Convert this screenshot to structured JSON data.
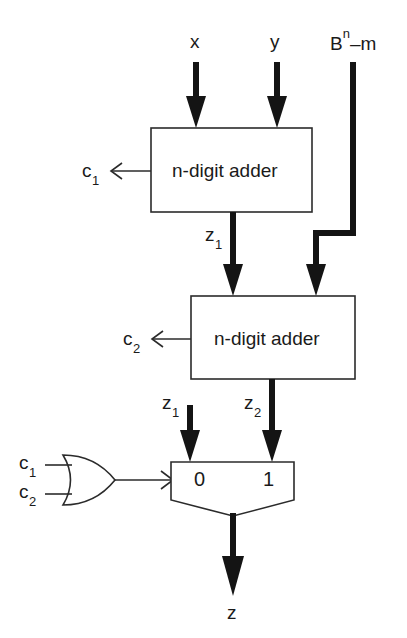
{
  "figure": {
    "type": "block-diagram",
    "background_color": "#ffffff",
    "line_color": "#2b2b2b",
    "signal_color": "#141414"
  },
  "inputs": {
    "x": "x",
    "y": "y",
    "constant": {
      "base": "B",
      "exponent": "n",
      "operation": "–m",
      "full": "Bⁿ–m"
    }
  },
  "blocks": {
    "adder1": {
      "label": "n-digit adder",
      "carry_out": "c",
      "carry_out_sub": "1",
      "sum_out": "z",
      "sum_out_sub": "1"
    },
    "adder2": {
      "label": "n-digit adder",
      "carry_out": "c",
      "carry_out_sub": "2",
      "sum_out": "z",
      "sum_out_sub": "2"
    },
    "or_gate": {
      "label": "OR",
      "input_a": "c",
      "input_a_sub": "1",
      "input_b": "c",
      "input_b_sub": "2"
    },
    "mux": {
      "select_0": "0",
      "select_1": "1",
      "input_0": "z",
      "input_0_sub": "1",
      "input_1": "z",
      "input_1_sub": "2"
    }
  },
  "outputs": {
    "result": "z"
  },
  "labels": {
    "x": "x",
    "y": "y",
    "bnm_base": "B",
    "bnm_exp": "n",
    "bnm_rest": "–m",
    "c_letter": "c",
    "z_letter": "z",
    "one": "1",
    "two": "2",
    "adder_text": "n-digit adder",
    "mux_zero": "0",
    "mux_one": "1",
    "output_z": "z"
  }
}
